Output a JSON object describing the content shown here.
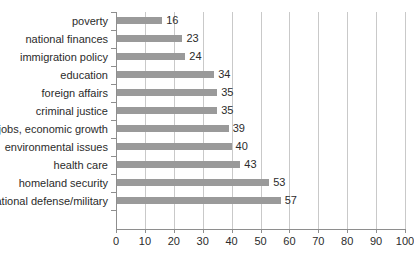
{
  "chart_data": {
    "type": "bar",
    "orientation": "horizontal",
    "title": "",
    "subtitle": "",
    "xlabel": "",
    "ylabel": "",
    "xlim": [
      0,
      100
    ],
    "xticks": [
      0,
      10,
      20,
      30,
      40,
      50,
      60,
      70,
      80,
      90,
      100
    ],
    "grid": true,
    "grid_axis": "x",
    "legend": false,
    "legend_position": "none",
    "bar_color": "#9a9a9a",
    "gridline_color": "#c9c9c9",
    "axis_color": "#8e8e8e",
    "text_color": "#2b2b2b",
    "categories": [
      "poverty",
      "national finances",
      "immigration policy",
      "education",
      "foreign affairs",
      "criminal justice",
      "jobs, economic growth",
      "environmental issues",
      "health care",
      "homeland security",
      "national defense/military"
    ],
    "values": [
      16,
      23,
      24,
      34,
      35,
      35,
      39,
      40,
      43,
      53,
      57
    ],
    "data_labels": [
      "16",
      "23",
      "24",
      "34",
      "35",
      "35",
      "39",
      "40",
      "43",
      "53",
      "57"
    ],
    "tick_labels": [
      "0",
      "10",
      "20",
      "30",
      "40",
      "50",
      "60",
      "70",
      "80",
      "90",
      "100"
    ]
  }
}
